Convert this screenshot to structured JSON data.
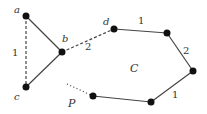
{
  "diagram": {
    "colors": {
      "edge": "#444444",
      "node": "#111111",
      "text": "#333333",
      "background": "#ffffff"
    },
    "nodes": [
      {
        "id": "a",
        "label": "a",
        "x": 26,
        "y": 16,
        "label_x": 14,
        "label_y": 13
      },
      {
        "id": "b",
        "label": "b",
        "x": 62,
        "y": 52,
        "label_x": 62,
        "label_y": 42
      },
      {
        "id": "c",
        "label": "c",
        "x": 26,
        "y": 87,
        "label_x": 14,
        "label_y": 100
      },
      {
        "id": "d",
        "label": "d",
        "x": 114,
        "y": 29,
        "label_x": 103,
        "label_y": 25
      },
      {
        "id": "e",
        "label": "",
        "x": 167,
        "y": 33
      },
      {
        "id": "f",
        "label": "",
        "x": 193,
        "y": 71
      },
      {
        "id": "g",
        "label": "",
        "x": 151,
        "y": 102
      },
      {
        "id": "h",
        "label": "",
        "x": 93,
        "y": 96
      }
    ],
    "edges": [
      {
        "from": "a",
        "to": "b",
        "style": "solid",
        "label": ""
      },
      {
        "from": "b",
        "to": "c",
        "style": "solid",
        "label": ""
      },
      {
        "from": "a",
        "to": "c",
        "style": "dashed",
        "label": "1",
        "label_x": 12,
        "label_y": 56
      },
      {
        "from": "b",
        "to": "d",
        "style": "dashed",
        "label": "2",
        "label_x": 85,
        "label_y": 50
      },
      {
        "from": "d",
        "to": "e",
        "style": "solid",
        "label": "1",
        "label_x": 138,
        "label_y": 24
      },
      {
        "from": "e",
        "to": "f",
        "style": "solid",
        "label": "2",
        "label_x": 183,
        "label_y": 54
      },
      {
        "from": "f",
        "to": "g",
        "style": "solid",
        "label": "1",
        "label_x": 172,
        "label_y": 98
      },
      {
        "from": "g",
        "to": "h",
        "style": "solid",
        "label": ""
      }
    ],
    "path_start": {
      "x1": 67,
      "y1": 84,
      "x2": 93,
      "y2": 96,
      "style": "dotted"
    },
    "region_labels": [
      {
        "text": "C",
        "x": 130,
        "y": 72
      },
      {
        "text": "P",
        "x": 68,
        "y": 107
      }
    ]
  }
}
